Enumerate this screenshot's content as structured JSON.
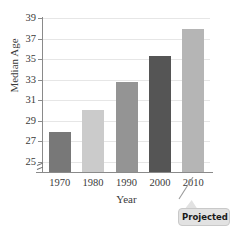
{
  "chart_data": {
    "type": "bar",
    "title": "",
    "xlabel": "Year",
    "ylabel": "Median Age",
    "categories": [
      "1970",
      "1980",
      "1990",
      "2000",
      "2010"
    ],
    "values": [
      27.9,
      30.0,
      32.8,
      35.3,
      37.9
    ],
    "ylim": [
      24,
      39
    ],
    "yticks": [
      25,
      27,
      29,
      31,
      33,
      35,
      37,
      39
    ],
    "ytick_labels": [
      "25",
      "27",
      "29",
      "31",
      "33",
      "35",
      "37",
      "39"
    ],
    "grid": true,
    "legend": false,
    "axis_break": true,
    "bar_colors": [
      "#787878",
      "#cbcbcb",
      "#949494",
      "#555555",
      "#b5b5b5"
    ],
    "annotations": [
      {
        "text": "Projected",
        "target_category": "2010",
        "style": "rounded-callout"
      }
    ]
  },
  "axes": {
    "y_title": "Median Age",
    "x_title": "Year"
  },
  "colors": {
    "background": "#ffffff",
    "axis": "#8a8a8a",
    "gridline": "#e6e6e6",
    "tick_text": "#3a3a3a",
    "callout_fill": "#e2e2e2",
    "callout_border": "#c9c9c9",
    "callout_text": "#1a1a1a"
  }
}
